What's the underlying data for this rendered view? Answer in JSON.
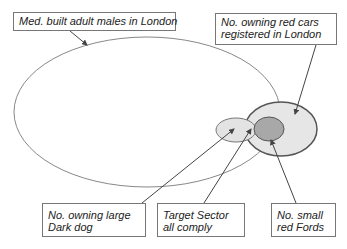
{
  "diagram": {
    "type": "venn",
    "sets": [
      {
        "id": "adult-males",
        "label": "Med. built adult males in London",
        "fill": "#ffffff",
        "stroke": "#888888"
      },
      {
        "id": "red-cars",
        "label": "No. owning red cars registered in London",
        "fill": "#e6e6e6",
        "stroke": "#555555"
      },
      {
        "id": "dark-dog",
        "label": "No. owning large Dark dog",
        "fill": "#e6e6e6",
        "stroke": "#777777"
      },
      {
        "id": "red-fords",
        "label": "No. small red Fords",
        "fill": "#aaaaaa",
        "stroke": "#555555"
      }
    ],
    "labels": {
      "adult_males": "Med. built adult males in London",
      "red_cars_line1": "No. owning red cars",
      "red_cars_line2": "registered in London",
      "dark_dog_line1": "No. owning large",
      "dark_dog_line2": "Dark dog",
      "target_line1": "Target Sector",
      "target_line2": "all comply",
      "red_fords_line1": "No. small",
      "red_fords_line2": "red Fords"
    }
  }
}
